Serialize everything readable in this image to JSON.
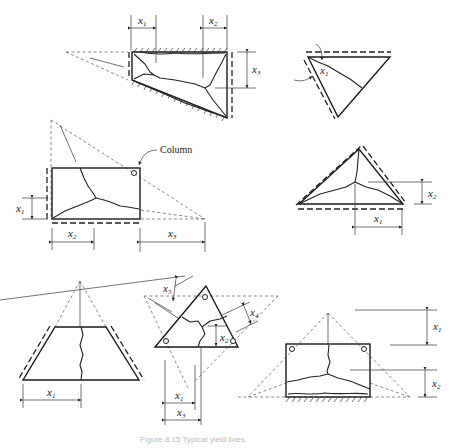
{
  "figure": {
    "caption": "Figure 8.15  Typical yield lines.",
    "annotations": {
      "column_label": "Column"
    },
    "panels": [
      {
        "id": "trapezoid-fixed-two-edges",
        "labels": {
          "a": "x",
          "a_sub": "1",
          "b": "x",
          "b_sub": "2",
          "c": "x",
          "c_sub": "3"
        }
      },
      {
        "id": "triangle-inverted",
        "labels": {
          "a": "x",
          "a_sub": "1"
        }
      },
      {
        "id": "rectangle-with-column",
        "labels": {
          "a": "x",
          "a_sub": "1",
          "b": "x",
          "b_sub": "2",
          "c": "x",
          "c_sub": "3"
        }
      },
      {
        "id": "triangle-three-edges",
        "labels": {
          "a": "x",
          "a_sub": "2",
          "b": "x",
          "b_sub": "1"
        }
      },
      {
        "id": "trapezoid-two-edges",
        "labels": {
          "a": "x",
          "a_sub": "1"
        }
      },
      {
        "id": "triangle-three-columns",
        "labels": {
          "a": "x",
          "a_sub": "5",
          "b": "x",
          "b_sub": "4",
          "c": "x",
          "c_sub": "2",
          "d": "x",
          "d_sub": "1",
          "e": "x",
          "e_sub": "3"
        }
      },
      {
        "id": "rectangle-two-columns-fixed-edge",
        "labels": {
          "a": "x",
          "a_sub": "1",
          "b": "x",
          "b_sub": "2"
        }
      }
    ]
  }
}
